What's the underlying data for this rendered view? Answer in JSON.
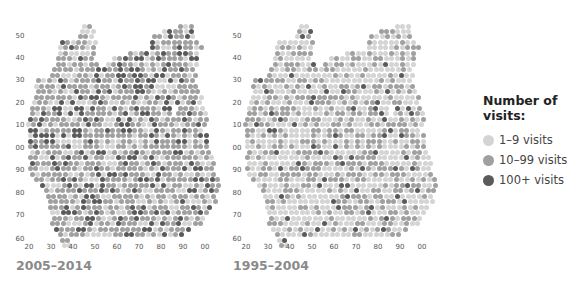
{
  "chart_data": [
    {
      "type": "scatter",
      "title": "2005–2014",
      "xlabel": "",
      "ylabel": "",
      "x_ticks": [
        "20",
        "30",
        "40",
        "50",
        "60",
        "70",
        "80",
        "90",
        "00"
      ],
      "y_ticks": [
        "50",
        "40",
        "30",
        "20",
        "10",
        "00",
        "90",
        "80",
        "70",
        "60"
      ],
      "description": "Dot-grid map of visit counts; darker dots = more visits",
      "dominant_category": "10–99 visits"
    },
    {
      "type": "scatter",
      "title": "1995–2004",
      "xlabel": "",
      "ylabel": "",
      "x_ticks": [
        "20",
        "30",
        "40",
        "50",
        "60",
        "70",
        "80",
        "90",
        "00"
      ],
      "y_ticks": [
        "50",
        "40",
        "30",
        "20",
        "10",
        "00",
        "90",
        "80",
        "70",
        "60"
      ],
      "description": "Dot-grid map of visit counts; lighter overall than 2005–2014",
      "dominant_category": "1–9 visits"
    }
  ],
  "legend": {
    "title": "Number of visits:",
    "items": [
      {
        "label": "1–9 visits",
        "color": "#d4d4d4"
      },
      {
        "label": "10–99 visits",
        "color": "#a0a0a0"
      },
      {
        "label": "100+ visits",
        "color": "#5a5a5a"
      }
    ]
  },
  "maps": [
    {
      "caption": "2005–2014",
      "offset_x": 0,
      "weights": [
        0.28,
        0.55,
        0.17
      ]
    },
    {
      "caption": "1995–2004",
      "offset_x": 217,
      "weights": [
        0.55,
        0.38,
        0.07
      ]
    }
  ],
  "axes": {
    "x_ticks": [
      {
        "label": "20",
        "x": 29
      },
      {
        "label": "30",
        "x": 51
      },
      {
        "label": "40",
        "x": 73
      },
      {
        "label": "50",
        "x": 95
      },
      {
        "label": "60",
        "x": 117
      },
      {
        "label": "70",
        "x": 139
      },
      {
        "label": "80",
        "x": 161
      },
      {
        "label": "90",
        "x": 183
      },
      {
        "label": "00",
        "x": 205
      }
    ],
    "x_tick_y": 247,
    "y_ticks": [
      {
        "label": "50",
        "y": 36
      },
      {
        "label": "40",
        "y": 58
      },
      {
        "label": "30",
        "y": 80
      },
      {
        "label": "20",
        "y": 103
      },
      {
        "label": "10",
        "y": 125
      },
      {
        "label": "00",
        "y": 148
      },
      {
        "label": "90",
        "y": 170
      },
      {
        "label": "80",
        "y": 193
      },
      {
        "label": "70",
        "y": 215
      },
      {
        "label": "60",
        "y": 239
      }
    ],
    "y_tick_x": 20
  },
  "shape_rows": [
    [
      26,
      [
        [
          84,
          92
        ],
        [
          180,
          192
        ]
      ]
    ],
    [
      31,
      [
        [
          82,
          94
        ],
        [
          164,
          194
        ]
      ]
    ],
    [
      36,
      [
        [
          80,
          96
        ],
        [
          154,
          196
        ]
      ]
    ],
    [
      42,
      [
        [
          62,
          96
        ],
        [
          152,
          200
        ]
      ]
    ],
    [
      47,
      [
        [
          60,
          96
        ],
        [
          152,
          202
        ]
      ]
    ],
    [
      53,
      [
        [
          60,
          96
        ],
        [
          130,
          150
        ],
        [
          152,
          200
        ]
      ]
    ],
    [
      58,
      [
        [
          58,
          96
        ],
        [
          114,
          198
        ]
      ]
    ],
    [
      64,
      [
        [
          58,
          98
        ],
        [
          108,
          196
        ]
      ]
    ],
    [
      69,
      [
        [
          54,
          100
        ],
        [
          104,
          196
        ]
      ]
    ],
    [
      75,
      [
        [
          52,
          196
        ]
      ]
    ],
    [
      80,
      [
        [
          38,
          196
        ]
      ]
    ],
    [
      86,
      [
        [
          36,
          198
        ]
      ]
    ],
    [
      91,
      [
        [
          38,
          200
        ]
      ]
    ],
    [
      97,
      [
        [
          36,
          202
        ]
      ]
    ],
    [
      102,
      [
        [
          34,
          204
        ]
      ]
    ],
    [
      108,
      [
        [
          32,
          172
        ],
        [
          180,
          206
        ]
      ]
    ],
    [
      113,
      [
        [
          32,
          170
        ],
        [
          178,
          208
        ]
      ]
    ],
    [
      119,
      [
        [
          30,
          208
        ]
      ]
    ],
    [
      124,
      [
        [
          28,
          206
        ]
      ]
    ],
    [
      130,
      [
        [
          30,
          204
        ]
      ]
    ],
    [
      135,
      [
        [
          30,
          206
        ]
      ]
    ],
    [
      141,
      [
        [
          30,
          208
        ]
      ]
    ],
    [
      146,
      [
        [
          30,
          208
        ]
      ]
    ],
    [
      152,
      [
        [
          32,
          210
        ]
      ]
    ],
    [
      157,
      [
        [
          30,
          212
        ]
      ]
    ],
    [
      163,
      [
        [
          32,
          214
        ]
      ]
    ],
    [
      168,
      [
        [
          30,
          216
        ]
      ]
    ],
    [
      174,
      [
        [
          32,
          216
        ]
      ]
    ],
    [
      179,
      [
        [
          36,
          218
        ]
      ]
    ],
    [
      185,
      [
        [
          42,
          218
        ]
      ]
    ],
    [
      190,
      [
        [
          46,
          218
        ]
      ]
    ],
    [
      196,
      [
        [
          48,
          218
        ]
      ]
    ],
    [
      201,
      [
        [
          50,
          216
        ]
      ]
    ],
    [
      207,
      [
        [
          50,
          214
        ]
      ]
    ],
    [
      212,
      [
        [
          52,
          210
        ]
      ]
    ],
    [
      218,
      [
        [
          54,
          206
        ]
      ]
    ],
    [
      223,
      [
        [
          52,
          202
        ]
      ]
    ],
    [
      229,
      [
        [
          56,
          192
        ]
      ]
    ],
    [
      234,
      [
        [
          60,
          186
        ]
      ]
    ],
    [
      240,
      [
        [
          62,
          72
        ]
      ]
    ],
    [
      245,
      [
        [
          64,
          72
        ]
      ]
    ]
  ],
  "caption_y": 258
}
